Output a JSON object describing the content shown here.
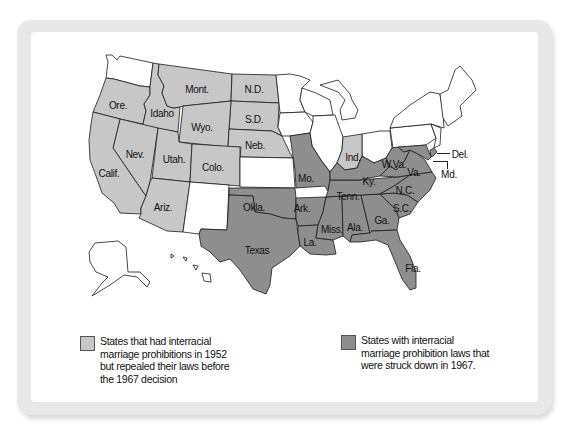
{
  "figure": {
    "title": "",
    "colors": {
      "repealed_before_1967": "#c7c7c7",
      "struck_down_1967": "#8e8e8e",
      "no_prohibition": "#ffffff"
    }
  },
  "states": {
    "repealed_before_1967": [
      "Ore.",
      "Idaho",
      "Mont.",
      "N.D.",
      "S.D.",
      "Wyo.",
      "Neb.",
      "Nev.",
      "Utah.",
      "Colo.",
      "Calif.",
      "Ariz.",
      "Ind."
    ],
    "struck_down_1967": [
      "Okla.",
      "Texas",
      "Mo.",
      "Ark.",
      "La.",
      "Miss.",
      "Ala.",
      "Ga.",
      "Fla.",
      "Tenn.",
      "Ky.",
      "W.Va.",
      "Va.",
      "N.C.",
      "S.C.",
      "Del.",
      "Md."
    ]
  },
  "labels": {
    "ore": "Ore.",
    "idaho": "Idaho",
    "mont": "Mont.",
    "nd": "N.D.",
    "sd": "S.D.",
    "wyo": "Wyo.",
    "neb": "Neb.",
    "nev": "Nev.",
    "utah": "Utah.",
    "colo": "Colo.",
    "calif": "Calif.",
    "ariz": "Ariz.",
    "okla": "Okla.",
    "texas": "Texas",
    "mo": "Mo.",
    "ark": "Ark.",
    "la": "La.",
    "miss": "Miss.",
    "ala": "Ala.",
    "ga": "Ga.",
    "fla": "Fla.",
    "tenn": "Tenn.",
    "ky": "Ky.",
    "ind": "Ind.",
    "wva": "W.Va.",
    "va": "Va.",
    "nc": "N.C.",
    "sc": "S.C.",
    "del": "Del.",
    "md": "Md."
  },
  "legend": [
    {
      "category": "repealed_before_1967",
      "text": "States that had interracial marriage prohibitions in 1952 but repealed their laws before the 1967 decision",
      "lines": [
        "States that had interracial",
        "marriage prohibitions in 1952",
        "but repealed their laws before",
        "the 1967 decision"
      ]
    },
    {
      "category": "struck_down_1967",
      "text": "States with interracial marriage prohibition laws that were struck down in 1967.",
      "lines": [
        "States with interracial",
        "marriage prohibition laws that",
        "were struck down in 1967."
      ]
    }
  ]
}
